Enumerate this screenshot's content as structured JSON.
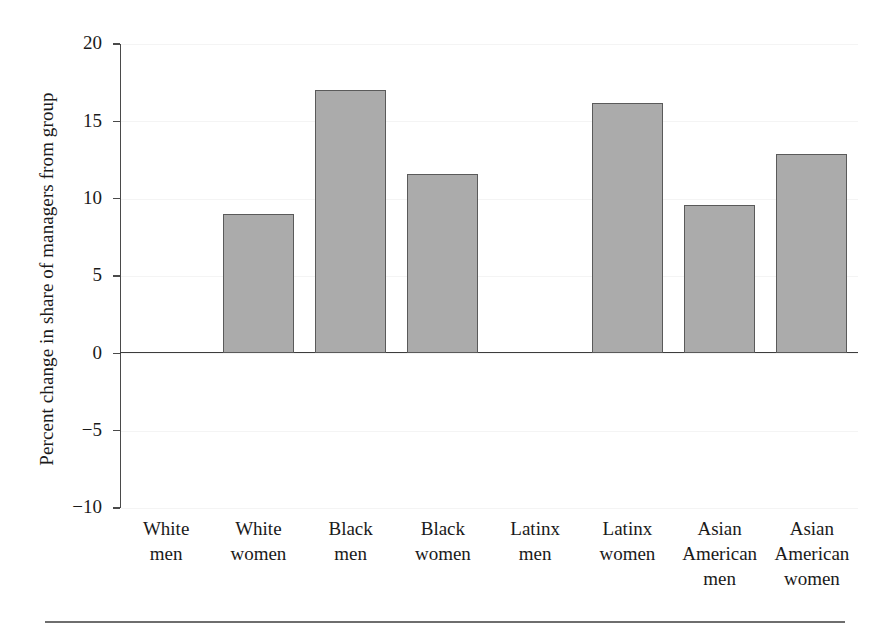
{
  "chart_data": {
    "type": "bar",
    "title": "",
    "subtitle": "",
    "xlabel": "",
    "ylabel": "Percent change in share of managers from group",
    "categories": [
      "White men",
      "White women",
      "Black men",
      "Black women",
      "Latinx men",
      "Latinx women",
      "Asian American men",
      "Asian American women"
    ],
    "category_lines": [
      [
        "White",
        "men"
      ],
      [
        "White",
        "women"
      ],
      [
        "Black",
        "men"
      ],
      [
        "Black",
        "women"
      ],
      [
        "Latinx",
        "men"
      ],
      [
        "Latinx",
        "women"
      ],
      [
        "Asian",
        "American",
        "men"
      ],
      [
        "Asian",
        "American",
        "women"
      ]
    ],
    "values": [
      0,
      9.0,
      17.0,
      11.6,
      0,
      16.2,
      9.6,
      12.9
    ],
    "ylim": [
      -10,
      20
    ],
    "yticks": [
      20,
      15,
      10,
      5,
      0,
      -5,
      -10
    ],
    "ytick_labels": [
      "20",
      "15",
      "10",
      "5",
      "0",
      "−5",
      "−10"
    ],
    "grid": true,
    "legend": "none",
    "bar_fill": "#ababab",
    "bar_edge": "#5a5a5a",
    "axis_color": "#3d3d3d"
  }
}
